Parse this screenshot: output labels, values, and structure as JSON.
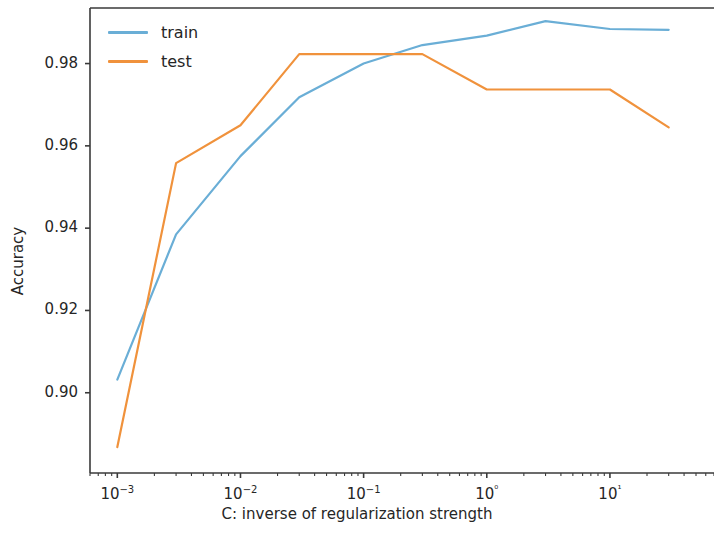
{
  "chart_data": {
    "type": "line",
    "title": "",
    "xlabel": "C: inverse of regularization strength",
    "ylabel": "Accuracy",
    "xscale": "log",
    "yscale": "linear",
    "xlim": [
      0.0006,
      70
    ],
    "ylim": [
      0.8805,
      0.9935
    ],
    "grid": false,
    "legend_position": "upper left",
    "x": [
      0.001,
      0.003,
      0.01,
      0.03,
      0.1,
      0.3,
      1,
      3,
      10,
      30
    ],
    "xtick_labels": [
      "10−3",
      "10−2",
      "10−1",
      "10⁰",
      "10¹"
    ],
    "xtick_values": [
      0.001,
      0.01,
      0.1,
      1,
      10
    ],
    "ytick_labels": [
      "0.90",
      "0.92",
      "0.94",
      "0.96",
      "0.98"
    ],
    "ytick_values": [
      0.9,
      0.92,
      0.94,
      0.96,
      0.98
    ],
    "series": [
      {
        "name": "train",
        "color": "#6aaed6",
        "values": [
          0.9032,
          0.9385,
          0.9575,
          0.9718,
          0.98,
          0.9845,
          0.9868,
          0.9903,
          0.9884,
          0.9882
        ]
      },
      {
        "name": "test",
        "color": "#f0923c",
        "values": [
          0.8868,
          0.9558,
          0.965,
          0.9823,
          0.9823,
          0.9823,
          0.9737,
          0.9737,
          0.9737,
          0.9645
        ]
      }
    ]
  },
  "legend": {
    "entries": [
      {
        "label": "train",
        "color": "#6aaed6"
      },
      {
        "label": "test",
        "color": "#f0923c"
      }
    ]
  },
  "axes": {
    "x_label": "C: inverse of regularization strength",
    "y_label": "Accuracy"
  }
}
